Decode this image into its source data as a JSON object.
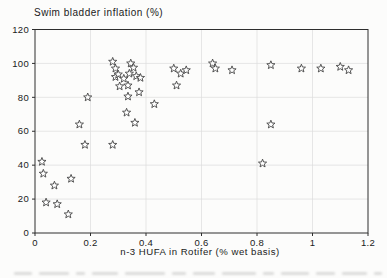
{
  "chart_data": {
    "type": "scatter",
    "title": "Swim bladder inflation (%)",
    "xlabel": "n-3 HUFA in Rotifer (% wet basis)",
    "ylabel": "Swim bladder inflation (%)",
    "xlim": [
      0,
      1.2
    ],
    "ylim": [
      0,
      120
    ],
    "x_ticks": [
      0,
      0.2,
      0.4,
      0.6,
      0.8,
      1,
      1.2
    ],
    "x_tick_labels": [
      "0",
      "0.2",
      "0.4",
      "0.6",
      "0.8",
      "1",
      "1.2"
    ],
    "y_ticks": [
      0,
      20,
      40,
      60,
      80,
      100,
      120
    ],
    "y_tick_labels": [
      "0",
      "20",
      "40",
      "60",
      "80",
      "100",
      "120"
    ],
    "grid": true,
    "legend": "none",
    "marker": "open-star",
    "points": [
      [
        0.025,
        42
      ],
      [
        0.03,
        35
      ],
      [
        0.04,
        18
      ],
      [
        0.07,
        28
      ],
      [
        0.08,
        17
      ],
      [
        0.12,
        11
      ],
      [
        0.13,
        32
      ],
      [
        0.16,
        64
      ],
      [
        0.18,
        52
      ],
      [
        0.19,
        80
      ],
      [
        0.28,
        52
      ],
      [
        0.28,
        101
      ],
      [
        0.29,
        97
      ],
      [
        0.29,
        92
      ],
      [
        0.3,
        93.5
      ],
      [
        0.32,
        91
      ],
      [
        0.345,
        100
      ],
      [
        0.355,
        97.5
      ],
      [
        0.34,
        94
      ],
      [
        0.365,
        92.5
      ],
      [
        0.38,
        91.5
      ],
      [
        0.305,
        86.5
      ],
      [
        0.335,
        87
      ],
      [
        0.335,
        80.5
      ],
      [
        0.375,
        83
      ],
      [
        0.33,
        71
      ],
      [
        0.36,
        65
      ],
      [
        0.43,
        76
      ],
      [
        0.5,
        97
      ],
      [
        0.51,
        87
      ],
      [
        0.525,
        94
      ],
      [
        0.545,
        96
      ],
      [
        0.64,
        100
      ],
      [
        0.65,
        97
      ],
      [
        0.71,
        96
      ],
      [
        0.85,
        99
      ],
      [
        0.96,
        97
      ],
      [
        1.03,
        97
      ],
      [
        1.1,
        98
      ],
      [
        1.13,
        96
      ],
      [
        0.85,
        64
      ],
      [
        0.82,
        41
      ]
    ],
    "colors": {
      "marker_stroke": "#454545",
      "marker_fill": "#ffffff",
      "grid": "#dcdcdc",
      "frame": "#2e2e2e",
      "text": "#1a1a1a",
      "background": "#fcfcfb"
    }
  }
}
